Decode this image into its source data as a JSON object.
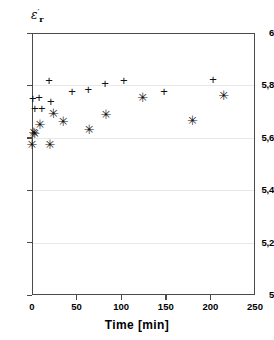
{
  "chart_data": {
    "type": "scatter",
    "title": "",
    "xlabel": "Time [min]",
    "ylabel": "ε'r",
    "xlim": [
      0,
      250
    ],
    "ylim": [
      5,
      6
    ],
    "grid": true,
    "legend": "none",
    "xticks": [
      "0",
      "50",
      "100",
      "150",
      "200",
      "250"
    ],
    "xtick_values": [
      0,
      50,
      100,
      150,
      200,
      250
    ],
    "yticks": [
      "5",
      "5,2",
      "5,4",
      "5,6",
      "5,8",
      "6"
    ],
    "ytick_values": [
      5,
      5.2,
      5.4,
      5.6,
      5.8,
      6
    ],
    "series": [
      {
        "name": "plus-series",
        "marker": "plus",
        "points": [
          {
            "x": 1,
            "y": 5.752
          },
          {
            "x": 3,
            "y": 5.713
          },
          {
            "x": 8,
            "y": 5.757
          },
          {
            "x": 11,
            "y": 5.713
          },
          {
            "x": 19,
            "y": 5.822
          },
          {
            "x": 21,
            "y": 5.742
          },
          {
            "x": 45,
            "y": 5.779
          },
          {
            "x": 63,
            "y": 5.788
          },
          {
            "x": 82,
            "y": 5.808
          },
          {
            "x": 103,
            "y": 5.82
          },
          {
            "x": 148,
            "y": 5.777
          },
          {
            "x": 203,
            "y": 5.826
          }
        ]
      },
      {
        "name": "star-series",
        "marker": "star",
        "points": [
          {
            "x": 0,
            "y": 5.578
          },
          {
            "x": 2,
            "y": 5.624
          },
          {
            "x": 3,
            "y": 5.617
          },
          {
            "x": 9,
            "y": 5.652
          },
          {
            "x": 20,
            "y": 5.575
          },
          {
            "x": 24,
            "y": 5.693
          },
          {
            "x": 35,
            "y": 5.663
          },
          {
            "x": 64,
            "y": 5.634
          },
          {
            "x": 83,
            "y": 5.692
          },
          {
            "x": 124,
            "y": 5.754
          },
          {
            "x": 180,
            "y": 5.669
          },
          {
            "x": 215,
            "y": 5.763
          }
        ]
      }
    ]
  },
  "markers": {
    "plus_glyph": "+",
    "star_glyph": "✳"
  }
}
